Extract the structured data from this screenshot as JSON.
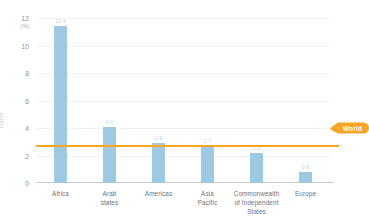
{
  "edge_caption": "Figure",
  "chart_data": {
    "type": "bar",
    "title": "",
    "xlabel": "",
    "ylabel": "",
    "yunit": "(%)",
    "ylim": [
      0,
      12
    ],
    "yticks": [
      "0",
      "2",
      "4",
      "6",
      "8",
      "10",
      "12"
    ],
    "ytick_values": [
      0,
      2,
      4,
      6,
      8,
      10,
      12
    ],
    "grid": true,
    "legend": "none",
    "categories": [
      "Africa",
      "Arab states",
      "Americas",
      "Asia Pacific",
      "Commonwealth of Independent States",
      "Europe"
    ],
    "category_lines": [
      [
        "Africa"
      ],
      [
        "Arab",
        "states"
      ],
      [
        "Americas"
      ],
      [
        "Asia",
        "Pacific"
      ],
      [
        "Commonwealth",
        "of Independent",
        "States"
      ],
      [
        "Europe"
      ]
    ],
    "values": [
      11.4,
      4.1,
      2.9,
      2.7,
      2.2,
      0.8
    ],
    "value_labels": [
      "11.4",
      "4.1",
      "2.9",
      "2.7",
      "2.2",
      "0.8"
    ],
    "bar_color": "#9ec9e2",
    "value_label_color": "#b9d6ea",
    "reference_line": {
      "label": "World",
      "value": 4.0,
      "color": "#f5a623"
    }
  }
}
